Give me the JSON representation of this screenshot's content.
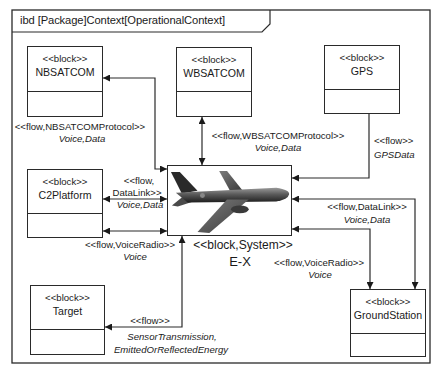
{
  "frame": {
    "title": "ibd [Package]Context[OperationalContext]"
  },
  "blocks": {
    "nbsatcom": {
      "stereotype": "<<block>>",
      "name": "NBSATCOM"
    },
    "wbsatcom": {
      "stereotype": "<<block>>",
      "name": "WBSATCOM"
    },
    "gps": {
      "stereotype": "<<block>>",
      "name": "GPS"
    },
    "c2platform": {
      "stereotype": "<<block>>",
      "name": "C2Platform"
    },
    "target": {
      "stereotype": "<<block>>",
      "name": "Target"
    },
    "groundstation": {
      "stereotype": "<<block>>",
      "name": "GroundStation"
    },
    "system": {
      "stereotype": "<<block,System>>",
      "name": "E-X",
      "image": "airplane-icon"
    }
  },
  "flows": {
    "nbsatcom": {
      "stereotype": "<<flow,NBSATCOMProtocol>>",
      "items": "Voice,Data"
    },
    "wbsatcom": {
      "stereotype": "<<flow,WBSATCOMProtocol>>",
      "items": "Voice,Data"
    },
    "gps": {
      "stereotype": "<<flow>>",
      "items": "GPSData"
    },
    "c2_datalink": {
      "stereotype_line1": "<<flow,",
      "stereotype_line2": "DataLink>>",
      "items": "Voice,Data"
    },
    "c2_voiceradio": {
      "stereotype": "<<flow,VoiceRadio>>",
      "items": "Voice"
    },
    "gs_datalink": {
      "stereotype": "<<flow,DataLink>>",
      "items": "Voice,Data"
    },
    "gs_voiceradio": {
      "stereotype": "<<flow,VoiceRadio>>",
      "items": "Voice"
    },
    "target": {
      "stereotype": "<<flow>>",
      "items_line1": "SensorTransmission,",
      "items_line2": "EmittedOrReflectedEnergy"
    }
  },
  "colors": {
    "line": "#2a2a2a",
    "background": "#ffffff",
    "airplane": "#5a5a5a"
  }
}
